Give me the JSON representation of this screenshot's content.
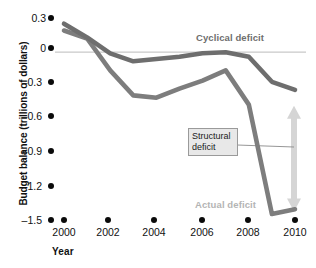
{
  "chart_data": {
    "type": "line",
    "title": "",
    "xlabel": "Year",
    "ylabel": "Budget balance (trillions of dollars)",
    "x": [
      2000,
      2001,
      2002,
      2003,
      2004,
      2005,
      2006,
      2007,
      2008,
      2009,
      2010
    ],
    "xlim": [
      2000,
      2010
    ],
    "ylim": [
      -1.5,
      0.3
    ],
    "xticks": [
      2000,
      2002,
      2004,
      2006,
      2008,
      2010
    ],
    "xtick_labels": [
      "2000",
      "2002",
      "2004",
      "2006",
      "2008",
      "2010"
    ],
    "yticks": [
      0.3,
      0,
      -0.3,
      -0.6,
      -0.9,
      -1.2,
      -1.5
    ],
    "ytick_labels": [
      "0.3",
      "0",
      "–0.3",
      "–0.6",
      "–0.9",
      "–1.2",
      "–1.5"
    ],
    "grid": false,
    "zero_line": true,
    "legend_position": "inline-labels",
    "series": [
      {
        "name": "Cyclical deficit",
        "color": "#6e6e6e",
        "values": [
          0.25,
          0.13,
          -0.01,
          -0.08,
          -0.06,
          -0.04,
          -0.01,
          0.0,
          -0.04,
          -0.26,
          -0.33
        ]
      },
      {
        "name": "Actual deficit",
        "color": "#7d7d7d",
        "values": [
          0.19,
          0.12,
          -0.16,
          -0.38,
          -0.4,
          -0.32,
          -0.25,
          -0.16,
          -0.46,
          -1.42,
          -1.38
        ]
      }
    ],
    "annotations": [
      {
        "name": "cyclical-deficit-label",
        "text": "Cyclical deficit",
        "color": "#6e6e6e"
      },
      {
        "name": "actual-deficit-label",
        "text": "Actual deficit",
        "color": "#b4b4b4"
      },
      {
        "name": "structural-deficit-callout",
        "text": "Structural deficit",
        "line1": "Structural",
        "line2": "deficit"
      }
    ],
    "arrow": {
      "name": "structural-deficit-arrow",
      "color": "#d5d5d5",
      "top_value": -0.47,
      "bottom_value": -1.4,
      "direction": "double"
    }
  }
}
